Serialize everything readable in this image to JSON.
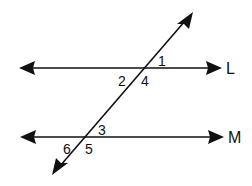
{
  "diagram": {
    "type": "parallel-lines-transversal",
    "stroke_color": "#111111",
    "background": "#ffffff",
    "lines": [
      {
        "id": "L",
        "label": "L",
        "y": 68,
        "x1": 19,
        "x2": 222,
        "arrows": "both"
      },
      {
        "id": "M",
        "label": "M",
        "y": 137,
        "x1": 20,
        "x2": 224,
        "arrows": "both"
      }
    ],
    "transversal": {
      "x1": 52,
      "y1": 175,
      "x2": 193,
      "y2": 12,
      "arrows": "both"
    },
    "angles": [
      {
        "label": "1",
        "x": 158,
        "y": 66
      },
      {
        "label": "2",
        "x": 118,
        "y": 86
      },
      {
        "label": "4",
        "x": 141,
        "y": 86
      },
      {
        "label": "3",
        "x": 98,
        "y": 135
      },
      {
        "label": "6",
        "x": 63,
        "y": 154
      },
      {
        "label": "5",
        "x": 85,
        "y": 154
      }
    ],
    "line_labels": [
      {
        "text": "L",
        "x": 226,
        "y": 74
      },
      {
        "text": "M",
        "x": 228,
        "y": 143
      }
    ]
  }
}
